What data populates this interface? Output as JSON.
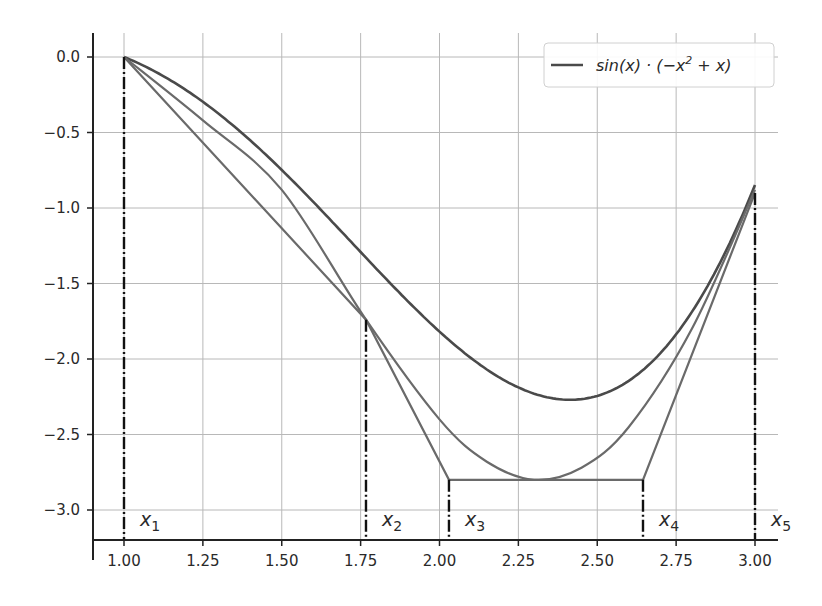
{
  "chart_data": {
    "type": "line",
    "title": "",
    "xlabel": "",
    "ylabel": "",
    "xlim": [
      0.9,
      3.08
    ],
    "ylim": [
      -3.2,
      0.12
    ],
    "grid": true,
    "legend_position": "upper right",
    "x_ticks": [
      1.0,
      1.25,
      1.5,
      1.75,
      2.0,
      2.25,
      2.5,
      2.75,
      3.0
    ],
    "x_tick_labels": [
      "1.00",
      "1.25",
      "1.50",
      "1.75",
      "2.00",
      "2.25",
      "2.50",
      "2.75",
      "3.00"
    ],
    "y_ticks": [
      0.0,
      -0.5,
      -1.0,
      -1.5,
      -2.0,
      -2.5,
      -3.0
    ],
    "y_tick_labels": [
      "0.0",
      "−0.5",
      "−1.0",
      "−1.5",
      "−2.0",
      "−2.5",
      "−3.0"
    ],
    "legend": [
      {
        "label": "sin(x) · (−x² + x)",
        "color": "#555555"
      }
    ],
    "series": [
      {
        "name": "sin(x) · (−x² + x)",
        "style": "solid",
        "color": "#4a4a4a",
        "function": "sin(x)*(-x^2+x)",
        "x": [
          1.0,
          1.25,
          1.5,
          1.75,
          2.0,
          2.25,
          2.4,
          2.5,
          2.75,
          3.0
        ],
        "y": [
          0.0,
          -0.297,
          -0.748,
          -1.286,
          -1.819,
          -2.199,
          -2.27,
          -2.244,
          -1.968,
          -0.847
        ]
      },
      {
        "name": "smooth approximation",
        "style": "solid",
        "color": "#6a6a6a",
        "x": [
          1.0,
          1.25,
          1.5,
          1.767,
          2.0,
          2.15,
          2.3,
          2.45,
          2.6,
          2.8,
          3.0
        ],
        "y": [
          0.0,
          -0.42,
          -0.88,
          -1.74,
          -2.4,
          -2.68,
          -2.8,
          -2.72,
          -2.45,
          -1.8,
          -0.88
        ]
      },
      {
        "name": "piecewise linear",
        "style": "solid",
        "color": "#6a6a6a",
        "x": [
          1.0,
          1.767,
          2.03,
          2.645,
          3.0
        ],
        "y": [
          0.0,
          -1.74,
          -2.8,
          -2.8,
          -0.9
        ]
      }
    ],
    "vertical_markers": [
      {
        "label": "x₁",
        "name": "x",
        "sub": "1",
        "x": 1.0,
        "y_top": 0.0
      },
      {
        "label": "x₂",
        "name": "x",
        "sub": "2",
        "x": 1.767,
        "y_top": -1.74
      },
      {
        "label": "x₃",
        "name": "x",
        "sub": "3",
        "x": 2.03,
        "y_top": -2.8
      },
      {
        "label": "x₄",
        "name": "x",
        "sub": "4",
        "x": 2.645,
        "y_top": -2.8
      },
      {
        "label": "x₅",
        "name": "x",
        "sub": "5",
        "x": 3.0,
        "y_top": -0.9
      }
    ]
  },
  "legend": {
    "label_pre": "sin(x) · (−x",
    "label_sup": "2",
    "label_post": " + x)"
  }
}
